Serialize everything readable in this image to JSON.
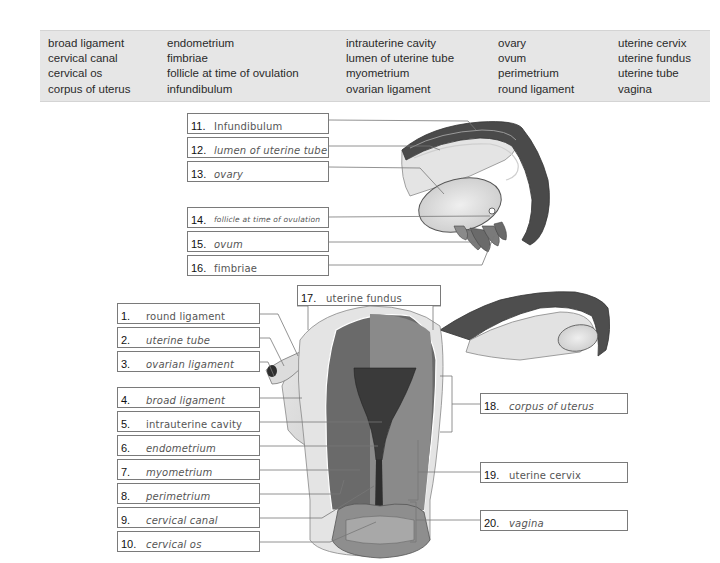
{
  "word_bank": {
    "columns": [
      [
        "broad ligament",
        "cervical canal",
        "cervical os",
        "corpus of uterus"
      ],
      [
        "endometrium",
        "fimbriae",
        "follicle at time of ovulation",
        "infundibulum"
      ],
      [
        "intrauterine cavity",
        "lumen of uterine tube",
        "myometrium",
        "ovarian ligament"
      ],
      [
        "ovary",
        "ovum",
        "perimetrium",
        "round ligament"
      ],
      [
        "uterine cervix",
        "uterine fundus",
        "uterine tube",
        "vagina"
      ]
    ],
    "background": "#e6e6e6"
  },
  "labels": {
    "l1": {
      "num": "1.",
      "answer": "round ligament"
    },
    "l2": {
      "num": "2.",
      "answer": "uterine tube"
    },
    "l3": {
      "num": "3.",
      "answer": "ovarian ligament"
    },
    "l4": {
      "num": "4.",
      "answer": "broad ligament"
    },
    "l5": {
      "num": "5.",
      "answer": "intrauterine cavity"
    },
    "l6": {
      "num": "6.",
      "answer": "endometrium"
    },
    "l7": {
      "num": "7.",
      "answer": "myometrium"
    },
    "l8": {
      "num": "8.",
      "answer": "perimetrium"
    },
    "l9": {
      "num": "9.",
      "answer": "cervical canal"
    },
    "l10": {
      "num": "10.",
      "answer": "cervical os"
    },
    "l11": {
      "num": "11.",
      "answer": "Infundibulum"
    },
    "l12": {
      "num": "12.",
      "answer": "lumen of uterine tube"
    },
    "l13": {
      "num": "13.",
      "answer": "ovary"
    },
    "l14": {
      "num": "14.",
      "answer": "follicle at time of ovulation"
    },
    "l15": {
      "num": "15.",
      "answer": "ovum"
    },
    "l16": {
      "num": "16.",
      "answer": "fimbriae"
    },
    "l17": {
      "num": "17.",
      "answer": "uterine fundus"
    },
    "l18": {
      "num": "18.",
      "answer": "corpus of uterus"
    },
    "l19": {
      "num": "19.",
      "answer": "uterine cervix"
    },
    "l20": {
      "num": "20.",
      "answer": "vagina"
    }
  },
  "figures": {
    "top": "ovary-and-uterine-tube-detail",
    "bottom": "uterus-coronal-section"
  }
}
